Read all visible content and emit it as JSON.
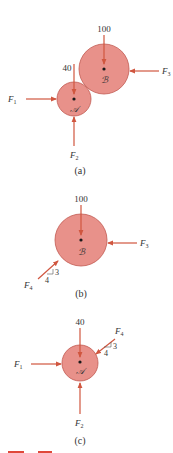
{
  "colors": {
    "disk_fill": "#e8918a",
    "disk_stroke": "#c25a52",
    "arrow": "#d0563f",
    "text": "#333333",
    "center_dot": "#1a1a1a"
  },
  "panels": [
    {
      "caption": "(a)",
      "bodies": [
        {
          "name": "B",
          "label": "ℬ"
        },
        {
          "name": "A",
          "label": "𝒜"
        }
      ],
      "forces": [
        {
          "name": "load-B",
          "label": "100"
        },
        {
          "name": "load-A",
          "label": "40"
        },
        {
          "name": "F1",
          "label": "F",
          "sub": "1"
        },
        {
          "name": "F2",
          "label": "F",
          "sub": "2"
        },
        {
          "name": "F3",
          "label": "F",
          "sub": "3"
        }
      ]
    },
    {
      "caption": "(b)",
      "bodies": [
        {
          "name": "B",
          "label": "ℬ"
        }
      ],
      "forces": [
        {
          "name": "load-B",
          "label": "100"
        },
        {
          "name": "F3",
          "label": "F",
          "sub": "3"
        },
        {
          "name": "F4",
          "label": "F",
          "sub": "4",
          "slope_rise": "3",
          "slope_run": "4"
        }
      ]
    },
    {
      "caption": "(c)",
      "bodies": [
        {
          "name": "A",
          "label": "𝒜"
        }
      ],
      "forces": [
        {
          "name": "load-A",
          "label": "40"
        },
        {
          "name": "F1",
          "label": "F",
          "sub": "1"
        },
        {
          "name": "F2",
          "label": "F",
          "sub": "2"
        },
        {
          "name": "F4",
          "label": "F",
          "sub": "4",
          "slope_rise": "3",
          "slope_run": "4"
        }
      ]
    }
  ]
}
